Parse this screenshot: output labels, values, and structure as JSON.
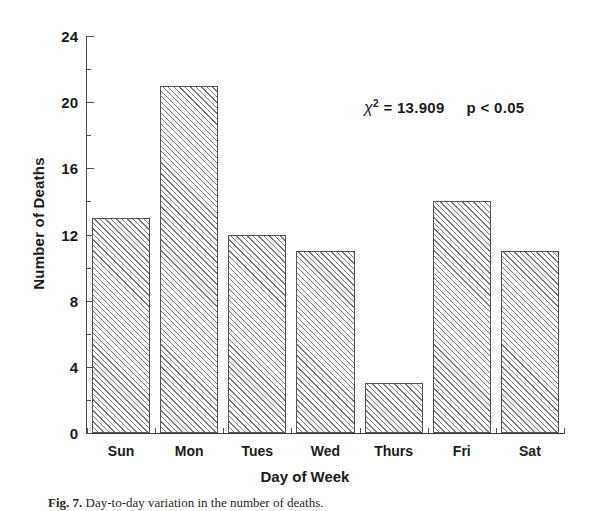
{
  "chart_data": {
    "type": "bar",
    "title": "",
    "categories": [
      "Sun",
      "Mon",
      "Tues",
      "Wed",
      "Thurs",
      "Fri",
      "Sat"
    ],
    "values": [
      13,
      21,
      12,
      11,
      3,
      14,
      11
    ],
    "series": [
      {
        "name": "Number of Deaths",
        "values": [
          13,
          21,
          12,
          11,
          3,
          14,
          11
        ]
      }
    ],
    "xlabel": "Day of Week",
    "ylabel": "Number of Deaths",
    "ylim": [
      0,
      24
    ],
    "ytick_values": [
      0,
      4,
      8,
      12,
      16,
      20,
      24
    ],
    "ytick_labels": [
      "0",
      "4",
      "8",
      "12",
      "16",
      "20",
      "24"
    ],
    "yminor_values": [
      2,
      6,
      10,
      14,
      18,
      22
    ],
    "grid": false,
    "legend": "none",
    "bar_style": {
      "fill": "hatched-diagonal",
      "fill_color": "#ffffff",
      "hatch_color": "#777777",
      "edge_color": "#555555"
    },
    "annotations": [
      {
        "name": "chi-square-statistic",
        "chi_symbol": "χ",
        "superscript": "2",
        "equals": "= 13.909",
        "p_value": "p < 0.05",
        "full_text": "χ2 = 13.909   p < 0.05"
      }
    ]
  },
  "axes": {
    "y_title": "Number of Deaths",
    "x_title": "Day of Week"
  },
  "caption": {
    "figure_number": "Fig. 7.",
    "text": "Day-to-day variation in the number of deaths."
  },
  "colors": {
    "axis": "#4c4c4c",
    "text": "#1a1a1a",
    "background": "#ffffff"
  }
}
